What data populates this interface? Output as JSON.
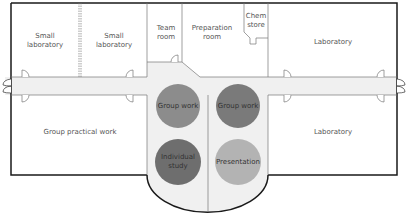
{
  "diagram": {
    "type": "floor-plan",
    "rooms": [
      {
        "id": "small-lab-1",
        "label_line1": "Small",
        "label_line2": "laboratory"
      },
      {
        "id": "small-lab-2",
        "label_line1": "Small",
        "label_line2": "laboratory"
      },
      {
        "id": "team-room",
        "label_line1": "Team",
        "label_line2": "room"
      },
      {
        "id": "preparation-room",
        "label_line1": "Preparation",
        "label_line2": "room"
      },
      {
        "id": "chem-store",
        "label_line1": "Chem",
        "label_line2": "store"
      },
      {
        "id": "laboratory-top",
        "label": "Laboratory"
      },
      {
        "id": "group-practical-work",
        "label": "Group practical work"
      },
      {
        "id": "laboratory-bottom",
        "label": "Laboratory"
      }
    ],
    "zones": [
      {
        "id": "group-work-left",
        "label": "Group work",
        "color": "#8c8c8c"
      },
      {
        "id": "group-work-right",
        "label": "Group work",
        "color": "#7a7a7a"
      },
      {
        "id": "individual-study",
        "label_line1": "Individual",
        "label_line2": "study",
        "color": "#6e6e6e"
      },
      {
        "id": "presentation",
        "label": "Presentation",
        "color": "#b3b3b3"
      }
    ],
    "colors": {
      "wall": "#1a1a1a",
      "inner_wall": "#666666",
      "corridor": "#f0f0f0",
      "background": "#ffffff"
    }
  }
}
